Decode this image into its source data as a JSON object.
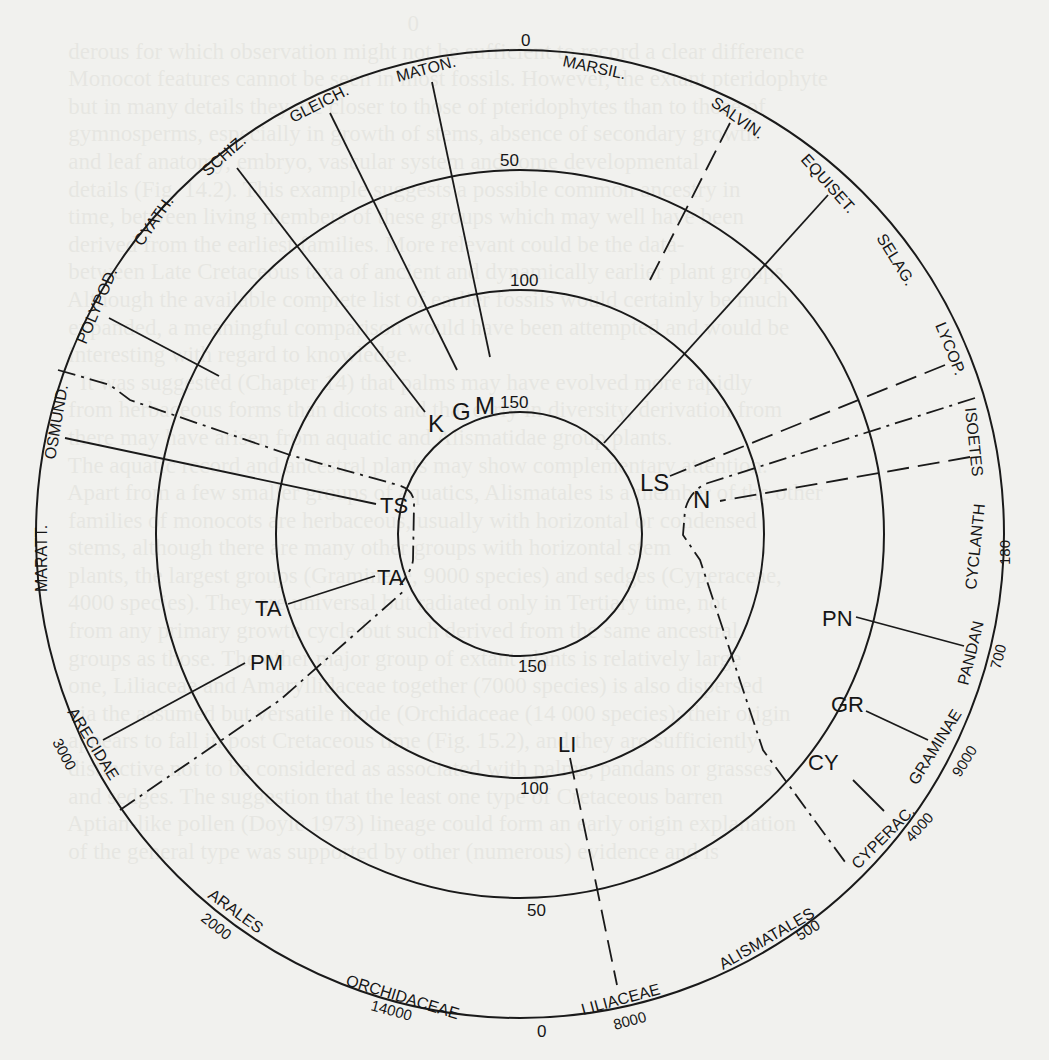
{
  "figure": {
    "center": [
      520,
      534
    ],
    "rings": [
      {
        "name": "ring-outer",
        "r": 484,
        "value_top": "0",
        "value_bottom": "0"
      },
      {
        "name": "ring-50",
        "r": 364,
        "value_top": "50",
        "value_bottom": "50"
      },
      {
        "name": "ring-100",
        "r": 244,
        "value_top": "100",
        "value_bottom": "100"
      },
      {
        "name": "ring-150",
        "r": 122,
        "value_top": "150",
        "value_bottom": "150"
      }
    ],
    "ring_value_labels": [
      {
        "text": "0",
        "x": 521,
        "y": 46,
        "size": 17
      },
      {
        "text": "50",
        "x": 500,
        "y": 166,
        "size": 17
      },
      {
        "text": "100",
        "x": 510,
        "y": 286,
        "size": 17
      },
      {
        "text": "150",
        "x": 500,
        "y": 408,
        "size": 17,
        "note": "inside M label"
      },
      {
        "text": "150",
        "x": 518,
        "y": 672,
        "size": 17
      },
      {
        "text": "100",
        "x": 520,
        "y": 794,
        "size": 17
      },
      {
        "text": "50",
        "x": 527,
        "y": 916,
        "size": 17
      },
      {
        "text": "0",
        "x": 537,
        "y": 1037,
        "size": 17
      }
    ],
    "outer_labels": [
      {
        "text": "MATON.",
        "x": 398,
        "y": 82,
        "rot": -15,
        "size": 16
      },
      {
        "text": "MARSIL.",
        "x": 562,
        "y": 66,
        "rot": 12,
        "size": 16
      },
      {
        "text": "GLEICH.",
        "x": 293,
        "y": 123,
        "rot": -27,
        "size": 16
      },
      {
        "text": "SALVIN.",
        "x": 710,
        "y": 105,
        "rot": 35,
        "size": 16
      },
      {
        "text": "SCHIZ.",
        "x": 208,
        "y": 177,
        "rot": -42,
        "size": 16
      },
      {
        "text": "EQUISET.",
        "x": 800,
        "y": 160,
        "rot": 48,
        "size": 16
      },
      {
        "text": "CYATH.",
        "x": 142,
        "y": 247,
        "rot": -55,
        "size": 16
      },
      {
        "text": "SELAG.",
        "x": 876,
        "y": 238,
        "rot": 58,
        "size": 16
      },
      {
        "text": "POLYPOD.",
        "x": 86,
        "y": 345,
        "rot": -67,
        "size": 16
      },
      {
        "text": "LYCOP.",
        "x": 935,
        "y": 325,
        "rot": 68,
        "size": 16
      },
      {
        "text": "OSMUND.",
        "x": 55,
        "y": 460,
        "rot": -80,
        "size": 16
      },
      {
        "text": "ISOETES",
        "x": 965,
        "y": 408,
        "rot": 84,
        "size": 16
      },
      {
        "text": "MARATT.",
        "x": 47,
        "y": 592,
        "rot": -90,
        "size": 16
      },
      {
        "text": "CYCLANTH",
        "x": 976,
        "y": 590,
        "rot": -84,
        "size": 16
      },
      {
        "text": "PANDAN",
        "x": 968,
        "y": 686,
        "rot": -76,
        "size": 16
      },
      {
        "text": "ARECIDAE",
        "x": 67,
        "y": 712,
        "rot": 58,
        "size": 16
      },
      {
        "text": "GRAMINAE",
        "x": 917,
        "y": 786,
        "rot": -58,
        "size": 16
      },
      {
        "text": "CYPERAC.",
        "x": 858,
        "y": 870,
        "rot": -45,
        "size": 16
      },
      {
        "text": "ARALES",
        "x": 207,
        "y": 897,
        "rot": 36,
        "size": 16
      },
      {
        "text": "ALISMATALES",
        "x": 723,
        "y": 970,
        "rot": -30,
        "size": 16
      },
      {
        "text": "ORCHIDACEAE",
        "x": 345,
        "y": 985,
        "rot": 17,
        "size": 16
      },
      {
        "text": "LILIACEAE",
        "x": 583,
        "y": 1015,
        "rot": -15,
        "size": 16
      }
    ],
    "species_counts": [
      {
        "text": "180",
        "x": 1010,
        "y": 565,
        "rot": -90,
        "size": 15
      },
      {
        "text": "700",
        "x": 1000,
        "y": 670,
        "rot": -75,
        "size": 15
      },
      {
        "text": "9000",
        "x": 960,
        "y": 778,
        "rot": -58,
        "size": 15
      },
      {
        "text": "4000",
        "x": 912,
        "y": 843,
        "rot": -48,
        "size": 15
      },
      {
        "text": "500",
        "x": 800,
        "y": 941,
        "rot": -32,
        "size": 15
      },
      {
        "text": "8000",
        "x": 615,
        "y": 1030,
        "rot": -15,
        "size": 15
      },
      {
        "text": "14000",
        "x": 370,
        "y": 1010,
        "rot": 15,
        "size": 15
      },
      {
        "text": "2000",
        "x": 200,
        "y": 920,
        "rot": 38,
        "size": 15
      },
      {
        "text": "3000",
        "x": 52,
        "y": 742,
        "rot": 62,
        "size": 15
      }
    ],
    "node_labels": [
      {
        "text": "M",
        "x": 475,
        "y": 414,
        "size": 24
      },
      {
        "text": "G",
        "x": 452,
        "y": 420,
        "size": 24
      },
      {
        "text": "K",
        "x": 428,
        "y": 432,
        "size": 24
      },
      {
        "text": "TS",
        "x": 380,
        "y": 513,
        "size": 22
      },
      {
        "text": "TA",
        "x": 377,
        "y": 585,
        "size": 22
      },
      {
        "text": "TA",
        "x": 255,
        "y": 616,
        "size": 22
      },
      {
        "text": "PM",
        "x": 250,
        "y": 670,
        "size": 22
      },
      {
        "text": "LS",
        "x": 640,
        "y": 491,
        "size": 24
      },
      {
        "text": "N",
        "x": 693,
        "y": 508,
        "size": 24
      },
      {
        "text": "PN",
        "x": 822,
        "y": 626,
        "size": 22
      },
      {
        "text": "GR",
        "x": 831,
        "y": 712,
        "size": 22
      },
      {
        "text": "CY",
        "x": 808,
        "y": 770,
        "size": 22
      },
      {
        "text": "LI",
        "x": 558,
        "y": 752,
        "size": 22
      }
    ],
    "spokes": [
      {
        "name": "spoke-maton",
        "style": "solid",
        "d": "M432,82 L490,357"
      },
      {
        "name": "spoke-gleich",
        "style": "solid",
        "d": "M330,113 L457,370"
      },
      {
        "name": "spoke-schiz",
        "style": "solid",
        "d": "M237,168 L425,412"
      },
      {
        "name": "spoke-polypod",
        "style": "solid",
        "d": "M109,318 L219,376"
      },
      {
        "name": "spoke-osmund",
        "style": "solid",
        "d": "M65,438 L376,504"
      },
      {
        "name": "spoke-osmund-dashdot",
        "style": "dashdot",
        "d": "M58,370 L110,385 L130,400 L290,455 L398,485 Q415,490 414,505 L413,560 Q412,570 400,585"
      },
      {
        "name": "spoke-salvin",
        "style": "dash",
        "d": "M730,123 L650,280"
      },
      {
        "name": "spoke-equiset",
        "style": "solid",
        "d": "M828,195 L604,443"
      },
      {
        "name": "spoke-lycop",
        "style": "dash",
        "d": "M945,365 L670,476"
      },
      {
        "name": "spoke-isoetes-dashdot",
        "style": "dashdot",
        "d": "M975,398 L708,483 Q690,490 685,510 L683,535 L700,560 L763,750 L848,866"
      },
      {
        "name": "spoke-isoetes-dash",
        "style": "dash",
        "d": "M970,457 L720,501"
      },
      {
        "name": "spoke-pandan",
        "style": "solid",
        "d": "M964,646 L856,617"
      },
      {
        "name": "spoke-graminae",
        "style": "solid",
        "d": "M928,740 L866,711"
      },
      {
        "name": "spoke-cyperac",
        "style": "solid",
        "d": "M884,811 L853,780"
      },
      {
        "name": "spoke-liliaceae",
        "style": "dash",
        "d": "M570,758 L617,985"
      },
      {
        "name": "spoke-arecidae",
        "style": "solid",
        "d": "M103,740 L245,663"
      },
      {
        "name": "spoke-arecidae-dashdot",
        "style": "dashdot",
        "d": "M120,810 L280,700 L405,590"
      },
      {
        "name": "link-ta-ta",
        "style": "solid",
        "d": "M288,604 L375,576"
      }
    ]
  },
  "background_text": "                                                                  0\n       derous for which observation might not be sufficient to record a clear difference\n       Monocot features cannot be seen in most fossils. However, the extant pteridophyte\n       but in many details they are closer to those of pteridophytes than to those of\n       gymnosperms, especially in growth of stems, absence of secondary growth\n       and leaf anatomy, embryo, vascular system and some developmental\n       details (Fig. 14.2). This example suggests a possible common ancestry in\n       time, between living members of these groups which may well have been\n       derived from the earliest families. More relevant could be the data-\n       between Late Cretaceous taxa of ancient and dynamically earlier plant groups\n       Although the available complete list of earlier fossils would certainly be much\n       expanded, a meaningful comparison would have been attempted and would be\n       interesting with regard to knowledge.\n         It was suggested (Chapter 14) that palms may have evolved more rapidly\n       from herbaceous forms than dicots and that early in diversity, derivation from\n       there may have arisen from aquatic and Alismatidae group plants.\n       The aquatic record and ancestral plants may show complementary attention.\n       Apart from a few smaller groups of aquatics, Alismatales is a member of the other\n       families of monocots are herbaceous, usually with horizontal or condensed\n       stems, although there are many other groups with horizontal stem\n       plants, the largest groups (Gramineae, 9000 species) and sedges (Cyperaceae,\n       4000 species). They are universal but radiated only in Tertiary time, not\n       from any primary growth cycle but such derived from the same ancestral\n       groups as those. The other major group of extant plants is relatively large\n       one, Liliaceae and Amaryllidaceae together (7000 species) is also dispersed\n       via the assumed but versatile mode (Orchidaceae (14 000 species); their origin\n       appears to fall in post Cretaceous time (Fig. 15.2), and they are sufficiently\n       distinctive not to be considered as associated with palms, pandans or grasses\n       and sedges. The suggestion that the least one type of Cretaceous barren\n       Aptian-like pollen (Doyle 1973) lineage could form an early origin explanation\n       of the general type was supported by other (numerous) evidence and is"
}
